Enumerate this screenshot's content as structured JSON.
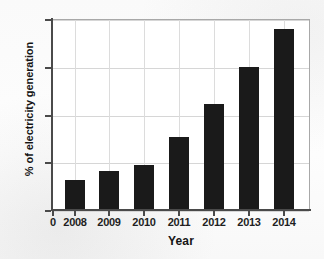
{
  "chart_data": {
    "type": "bar",
    "title": "",
    "xlabel": "Year",
    "ylabel": "% of electricity generation",
    "categories": [
      "2008",
      "2009",
      "2010",
      "2011",
      "2012",
      "2013",
      "2014"
    ],
    "values": [
      1.5,
      2.0,
      2.3,
      3.75,
      5.5,
      7.45,
      9.4
    ],
    "series": [
      {
        "name": "% of electricity generation",
        "values": [
          1.5,
          2.0,
          2.3,
          3.75,
          5.5,
          7.45,
          9.4
        ]
      }
    ],
    "ylim": [
      0,
      10
    ],
    "yticks": [
      "0",
      "2.5",
      "5",
      "7.5",
      "10"
    ],
    "ytick_values": [
      0,
      2.5,
      5,
      7.5,
      10
    ],
    "xticks": [
      "0",
      "2008",
      "2009",
      "2010",
      "2011",
      "2012",
      "2013",
      "2014"
    ],
    "grid": true,
    "legend": false,
    "legend_position": "none",
    "bar_color": "#1a1a1a",
    "grid_color": "#d6d6d6",
    "axis_color": "#4a4a4a",
    "background_color": "#ffffff"
  }
}
